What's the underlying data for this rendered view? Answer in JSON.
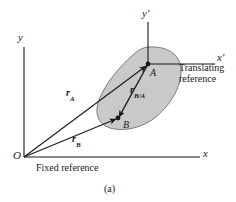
{
  "figure": {
    "caption": "(a)",
    "colors": {
      "body_fill": "#c9c9c9",
      "body_stroke": "#6e6e6e",
      "line": "#1a1a1a",
      "background": "#ffffff"
    },
    "axes": {
      "fixed": {
        "origin_label": "O",
        "x_label": "x",
        "y_label": "y",
        "note": "Fixed reference"
      },
      "translating": {
        "x_label": "x′",
        "y_label": "y′",
        "note_line1": "Translating",
        "note_line2": "reference"
      }
    },
    "points": [
      {
        "name": "A",
        "label": "A"
      },
      {
        "name": "B",
        "label": "B"
      }
    ],
    "vectors": [
      {
        "name": "r-A",
        "symbol": "r",
        "subscript": "A",
        "from": "O",
        "to": "A"
      },
      {
        "name": "r-B",
        "symbol": "r",
        "subscript": "B",
        "from": "O",
        "to": "B"
      },
      {
        "name": "r-B-A",
        "symbol": "r",
        "subscript": "B/A",
        "from": "A",
        "to": "B"
      }
    ]
  }
}
